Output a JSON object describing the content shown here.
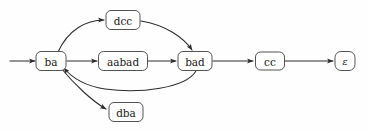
{
  "figure": {
    "name": "automaton-state-graph",
    "background_color": "#fefefe",
    "edge_color": "#2b2b2b",
    "node_stroke_color": "#404040",
    "node_fill_color": "#ffffff",
    "label_color": "#1a1a1a"
  },
  "nodes": [
    {
      "id": "ba",
      "label": "ba",
      "cx": 51,
      "cy": 61,
      "w": 30,
      "h": 19,
      "rx": 5
    },
    {
      "id": "dcc",
      "label": "dcc",
      "cx": 123,
      "cy": 20,
      "w": 34,
      "h": 19,
      "rx": 5
    },
    {
      "id": "aabad",
      "label": "aabad",
      "cx": 123,
      "cy": 61,
      "w": 49,
      "h": 19,
      "rx": 5
    },
    {
      "id": "bad",
      "label": "bad",
      "cx": 195,
      "cy": 61,
      "w": 34,
      "h": 19,
      "rx": 5
    },
    {
      "id": "dba",
      "label": "dba",
      "cx": 126,
      "cy": 112,
      "w": 34,
      "h": 19,
      "rx": 5
    },
    {
      "id": "cc",
      "label": "cc",
      "cx": 270,
      "cy": 61,
      "w": 29,
      "h": 18,
      "rx": 5
    },
    {
      "id": "eps",
      "label": "ε",
      "cx": 345,
      "cy": 61,
      "w": 20,
      "h": 19,
      "rx": 6
    }
  ],
  "edges": [
    {
      "id": "start-to-ba",
      "from": "start",
      "to": "ba",
      "path": "M 10,61 L 35,61",
      "arrow": true
    },
    {
      "id": "ba-to-dcc",
      "from": "ba",
      "to": "dcc",
      "path": "M 58,52 C 68,30 86,20 104,20",
      "arrow": true
    },
    {
      "id": "dcc-to-bad",
      "from": "dcc",
      "to": "bad",
      "path": "M 141,21 C 166,25 184,38 192,50",
      "arrow": true
    },
    {
      "id": "ba-to-aabad",
      "from": "ba",
      "to": "aabad",
      "path": "M 67,61 L 97,61",
      "arrow": true
    },
    {
      "id": "aabad-to-bad",
      "from": "aabad",
      "to": "bad",
      "path": "M 148,61 L 176,61",
      "arrow": true
    },
    {
      "id": "bad-to-ba",
      "from": "bad",
      "to": "ba",
      "path": "M 196,71 C 186,88 140,94 105,89 C 86,86 72,78 64,68",
      "arrow": true
    },
    {
      "id": "ba-to-dba",
      "from": "ba",
      "to": "dba",
      "path": "M 61,68 C 74,84 92,101 106,109",
      "arrow": true
    },
    {
      "id": "bad-to-cc",
      "from": "bad",
      "to": "cc",
      "path": "M 213,61 L 253,61",
      "arrow": true
    },
    {
      "id": "cc-to-eps",
      "from": "cc",
      "to": "eps",
      "path": "M 285,61 L 333,61",
      "arrow": true
    }
  ]
}
